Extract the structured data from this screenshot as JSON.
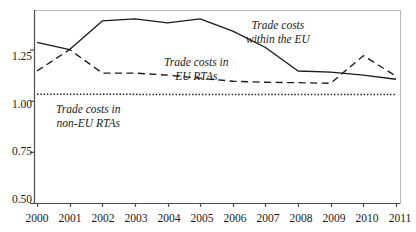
{
  "chart_data": {
    "type": "line",
    "title": "",
    "subtitle": "",
    "xlabel": "",
    "ylabel": "",
    "grid": false,
    "legend_position": "inline-annotations",
    "categories": [
      "2000",
      "2001",
      "2002",
      "2003",
      "2004",
      "2005",
      "2006",
      "2007",
      "2008",
      "2009",
      "2010",
      "2011"
    ],
    "x": [
      2000,
      2001,
      2002,
      2003,
      2004,
      2005,
      2006,
      2007,
      2008,
      2009,
      2010,
      2011
    ],
    "xlim": [
      2000,
      2011
    ],
    "ylim": [
      0.5,
      1.4
    ],
    "yticks": [
      0.5,
      0.75,
      1.0,
      1.25
    ],
    "ytick_labels": [
      "0.50",
      "0.75",
      "1.00",
      "1.25"
    ],
    "xtick_labels": [
      "2000",
      "2001",
      "2002",
      "2003",
      "2004",
      "2005",
      "2006",
      "2007",
      "2008",
      "2009",
      "2010",
      "2011"
    ],
    "series": [
      {
        "name": "Trade costs within the EU",
        "style": "solid",
        "color": "#1a1a1a",
        "values": [
          1.285,
          1.25,
          1.39,
          1.4,
          1.38,
          1.4,
          1.34,
          1.26,
          1.145,
          1.14,
          1.125,
          1.105
        ]
      },
      {
        "name": "Trade costs in EU RTAs",
        "style": "dashed",
        "color": "#1a1a1a",
        "values": [
          1.145,
          1.25,
          1.135,
          1.135,
          1.125,
          1.11,
          1.095,
          1.09,
          1.088,
          1.085,
          1.22,
          1.12
        ]
      },
      {
        "name": "Trade costs in non-EU RTAs",
        "style": "dotted",
        "color": "#1a1a1a",
        "values": [
          1.032,
          1.032,
          1.031,
          1.031,
          1.03,
          1.03,
          1.03,
          1.03,
          1.03,
          1.03,
          1.03,
          1.03
        ]
      }
    ],
    "annotations": [
      {
        "id": "within-eu",
        "lines": [
          "Trade costs",
          "within the EU"
        ],
        "series": "Trade costs within the EU"
      },
      {
        "id": "eu-rtas",
        "lines": [
          "Trade costs in",
          "EU RTAs"
        ],
        "series": "Trade costs in EU RTAs"
      },
      {
        "id": "non-eu-rtas",
        "lines": [
          "Trade costs in",
          "non-EU RTAs"
        ],
        "series": "Trade costs in non-EU RTAs"
      }
    ]
  }
}
